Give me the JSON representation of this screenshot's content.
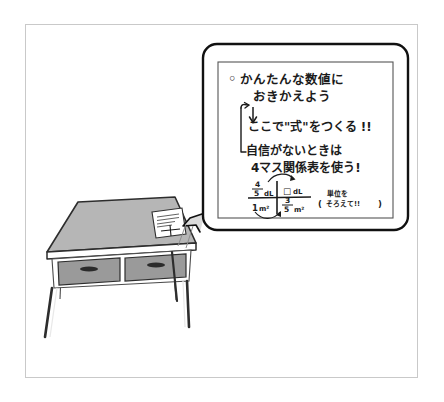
{
  "figure": {
    "kind": "hand-drawn-illustration",
    "title": "",
    "frame_color": "#c9c9c9",
    "background": "#ffffff",
    "ink_color": "#1b1b1b"
  },
  "callout": {
    "name": "speech-bubble",
    "border_color": "#111111",
    "inner_border_color": "#555555",
    "lines": [
      {
        "bullet": "◦",
        "text": "かんたんな数値に"
      },
      {
        "bullet": "",
        "text": "おきかえよう"
      },
      {
        "bullet": "",
        "text": "ここで\"式\"をつくる !!"
      },
      {
        "bullet": "",
        "text": "自信がないときは"
      },
      {
        "bullet": "",
        "text": "4マス関係表を使う!"
      }
    ],
    "arrow_down": "↓",
    "bracket": "⌐",
    "note": {
      "line1": "単位を",
      "line2": "そろえて!!",
      "open_paren": "(",
      "close_paren": ")"
    }
  },
  "four_cell_table": {
    "name": "4-masu-kankeihyou",
    "cells": [
      {
        "position": "top-left",
        "numerator": "4",
        "denominator": "5",
        "unit": "dL",
        "is_box": false
      },
      {
        "position": "top-right",
        "numerator": "",
        "denominator": "",
        "unit": "dL",
        "is_box": true,
        "box_glyph": "□"
      },
      {
        "position": "bottom-left",
        "numerator": "",
        "denominator": "",
        "whole": "1",
        "unit": "m²",
        "is_box": false
      },
      {
        "position": "bottom-right",
        "numerator": "3",
        "denominator": "5",
        "unit": "m²",
        "is_box": false
      }
    ],
    "arrows": [
      {
        "name": "top-arc-arrow",
        "from": "top-left",
        "to": "top-right",
        "glyph": "⌒"
      },
      {
        "name": "bottom-arc-arrow",
        "from": "bottom-left",
        "to": "bottom-right",
        "glyph": "⌣"
      }
    ]
  },
  "scene": {
    "desk": {
      "name": "school-desk",
      "top_color": "#b6b6b6",
      "body_color": "#ffffff",
      "leg_color": "#e8e8e8",
      "drawers": [
        {
          "name": "drawer-left",
          "color": "#9a9a9a",
          "handle_color": "#2b2b2b"
        },
        {
          "name": "drawer-right",
          "color": "#9a9a9a",
          "handle_color": "#2b2b2b"
        }
      ]
    },
    "worksheet": {
      "name": "worksheet-paper",
      "color": "#ffffff",
      "scribble_lines": 4,
      "has_cross_table": true
    },
    "pointer": {
      "name": "callout-tail",
      "color": "#111111"
    }
  }
}
